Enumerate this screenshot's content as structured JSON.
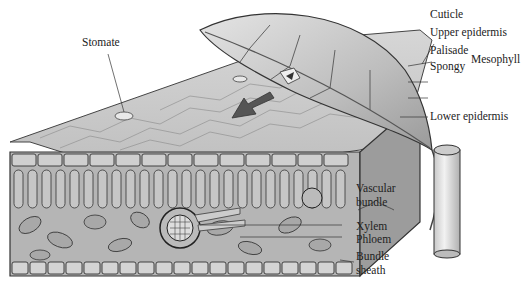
{
  "figure": {
    "caption_fragment": "",
    "labels": {
      "stomate": "Stomate",
      "cuticle": "Cuticle",
      "upper_epidermis": "Upper epidermis",
      "palisade": "Palisade",
      "spongy": "Spongy",
      "mesophyll": "Mesophyll",
      "lower_epidermis": "Lower epidermis",
      "vascular_bundle_line1": "Vascular",
      "vascular_bundle_line2": "bundle",
      "xylem": "Xylem",
      "phloem": "Phloem",
      "bundle_sheath_line1": "Bundle",
      "bundle_sheath_line2": "sheath"
    }
  }
}
